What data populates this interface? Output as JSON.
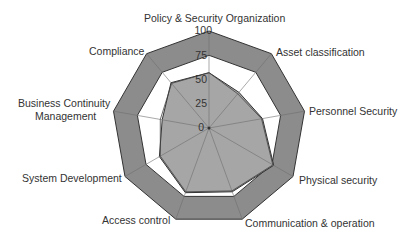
{
  "chart_data": {
    "type": "radar",
    "title": "",
    "axes": [
      "Policy & Security Organization",
      "Asset classification",
      "Personnel Security",
      "Physical security",
      "Communication & operation",
      "Access control",
      "System Development",
      "Business Continuity Management",
      "Compliance"
    ],
    "rlim": [
      0,
      100
    ],
    "r_ticks": [
      "0",
      "25",
      "50",
      "75",
      "100"
    ],
    "grid": true,
    "legend": "none",
    "series": [
      {
        "name": "Target (outer band)",
        "values": [
          100,
          100,
          100,
          100,
          100,
          100,
          100,
          100,
          100
        ],
        "fill": "#8c8c8c"
      },
      {
        "name": "Inner band limit",
        "values": [
          75,
          75,
          75,
          75,
          75,
          75,
          75,
          75,
          75
        ],
        "fill": "#ffffff"
      },
      {
        "name": "Assessment A",
        "values": [
          57,
          48,
          56,
          77,
          70,
          71,
          59,
          49,
          61
        ],
        "fill": "#a6a6a6"
      },
      {
        "name": "Assessment B",
        "values": [
          57,
          46,
          55,
          76,
          69,
          70,
          58,
          51,
          60
        ],
        "fill": "none"
      }
    ]
  },
  "labels": {
    "axis_0": "Policy & Security Organization",
    "axis_1": "Asset classification",
    "axis_2": "Personnel Security",
    "axis_3": "Physical security",
    "axis_4": "Communication & operation",
    "axis_5": "Access control",
    "axis_6": "System Development",
    "axis_7a": "Business Continuity",
    "axis_7b": "Management",
    "axis_8": "Compliance",
    "tick_0": "0",
    "tick_25": "25",
    "tick_50": "50",
    "tick_75": "75",
    "tick_100": "100"
  }
}
